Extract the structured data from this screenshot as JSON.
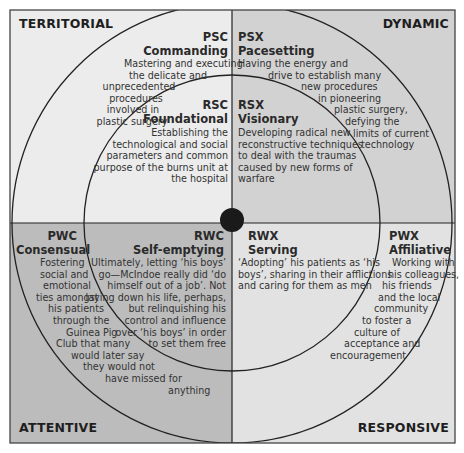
{
  "diagram": {
    "colors": {
      "territorial_bg": "#ececec",
      "dynamic_bg": "#d2d2d2",
      "attentive_bg": "#bcbcbc",
      "responsive_bg": "#e2e2e2",
      "line": "#222222",
      "center_dot": "#1a1a1a"
    },
    "corners": {
      "top_left": "TERRITORIAL",
      "top_right": "DYNAMIC",
      "bottom_left": "ATTENTIVE",
      "bottom_right": "RESPONSIVE"
    },
    "cells": {
      "psc": {
        "code": "PSC",
        "name": "Commanding",
        "lines": [
          "Mastering and executing",
          "the delicate and",
          "unprecedented",
          "procedures",
          "involved in",
          "plastic surgery"
        ]
      },
      "rsc": {
        "code": "RSC",
        "name": "Foundational",
        "lines": [
          "Establishing the",
          "technological and social",
          "parameters and common",
          "purpose of the burns unit at",
          "the hospital"
        ]
      },
      "psx": {
        "code": "PSX",
        "name": "Pacesetting",
        "lines": [
          "Having the energy and",
          "drive to establish many",
          "new procedures",
          "in pioneering",
          "plastic surgery,",
          "defying the",
          "limits of current",
          "technology"
        ]
      },
      "rsx": {
        "code": "RSX",
        "name": "Visionary",
        "lines": [
          "Developing radical new",
          "reconstructive techniques",
          "to deal with the traumas",
          "caused by new forms of",
          "warfare"
        ]
      },
      "pwc": {
        "code": "PWC",
        "name": "Consensual",
        "lines": [
          "Fostering",
          "social and",
          "emotional",
          "ties amongst",
          "his patients",
          "through the",
          "Guinea Pig",
          "Club that many",
          "would later say",
          "they would not",
          "have missed for",
          "anything"
        ]
      },
      "rwc": {
        "code": "RWC",
        "name": "Self-emptying",
        "lines": [
          "Ultimately, letting ‘his boys’",
          "go—McIndoe really did ‘do",
          "himself out of a job’. Not",
          "laying down his life, perhaps,",
          "but relinquishing his",
          "control and influence",
          "over ‘his boys’ in order",
          "to set them free"
        ]
      },
      "rwx": {
        "code": "RWX",
        "name": "Serving",
        "lines": [
          "‘Adopting’ his patients as ‘his",
          "boys’, sharing in their afflictions",
          "and caring for them as men"
        ]
      },
      "pwx": {
        "code": "PWX",
        "name": "Affiliative",
        "lines": [
          "Working with",
          "his colleagues,",
          "his friends",
          "and the local",
          "community",
          "to foster a",
          "culture of",
          "acceptance and",
          "encouragement"
        ]
      }
    }
  }
}
